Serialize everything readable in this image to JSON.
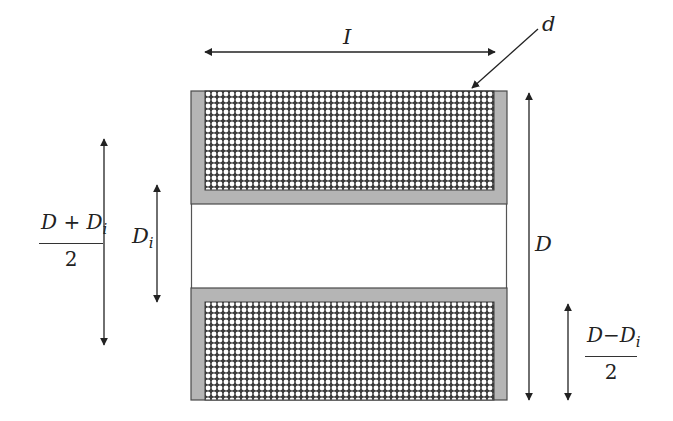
{
  "figure": {
    "type": "solenoid-coil-cross-section",
    "colors": {
      "background": "#ffffff",
      "bobbin_fill": "#b5b5b5",
      "outline": "#4a4a4a",
      "winding_bg": "#3c3c3c",
      "wire": "#ffffff",
      "arrow": "#222222"
    }
  },
  "labels": {
    "length": "I",
    "wire_diameter": "d",
    "inner_diameter": {
      "main": "D",
      "sub": "i"
    },
    "outer_diameter": "D",
    "mean_diameter": {
      "numerator_main": "D + D",
      "numerator_sub": "i",
      "denominator": "2"
    },
    "winding_depth": {
      "numerator_main": "D−D",
      "numerator_sub": "i",
      "denominator": "2"
    }
  }
}
